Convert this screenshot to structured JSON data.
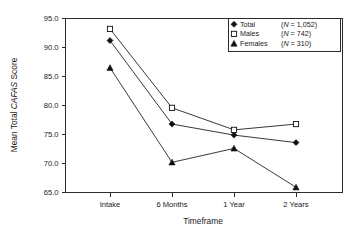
{
  "chart_data": {
    "type": "line",
    "title": "",
    "xlabel": "Timeframe",
    "ylabel": "Mean Total CAFAS Score",
    "ylabel_italic_part": "CAFAS",
    "categories": [
      "Intake",
      "6 Months",
      "1 Year",
      "2 Years"
    ],
    "yticks": [
      "65.0",
      "70.0",
      "75.0",
      "80.0",
      "85.0",
      "90.0",
      "95.0"
    ],
    "ylim": [
      65.0,
      95.0
    ],
    "grid": false,
    "legend_position": "top-right",
    "series": [
      {
        "name": "Total",
        "n_label": "(N = 1,052)",
        "marker": "filled-diamond",
        "values": [
          91.2,
          76.8,
          74.9,
          73.6
        ]
      },
      {
        "name": "Males",
        "n_label": "(N = 742)",
        "marker": "open-square",
        "values": [
          93.2,
          79.6,
          75.8,
          76.8
        ]
      },
      {
        "name": "Females",
        "n_label": "(N = 310)",
        "marker": "filled-triangle",
        "values": [
          86.5,
          70.2,
          72.6,
          65.9
        ]
      }
    ]
  },
  "legend": {
    "entries": [
      {
        "label": "Total",
        "n_text": "(N = 1,052)"
      },
      {
        "label": "Males",
        "n_text": "(N = 742)"
      },
      {
        "label": "Females",
        "n_text": "(N = 310)"
      }
    ]
  },
  "axes": {
    "y_title": "Mean Total CAFAS Score",
    "x_title": "Timeframe",
    "y_tick_labels": [
      "95.0",
      "90.0",
      "85.0",
      "80.0",
      "75.0",
      "70.0",
      "65.0"
    ],
    "x_tick_labels": [
      "Intake",
      "6 Months",
      "1 Year",
      "2 Years"
    ]
  },
  "colors": {
    "ink": "#1a1a1a",
    "line": "#222222",
    "frame": "#2b2b2b",
    "background": "#ffffff"
  }
}
